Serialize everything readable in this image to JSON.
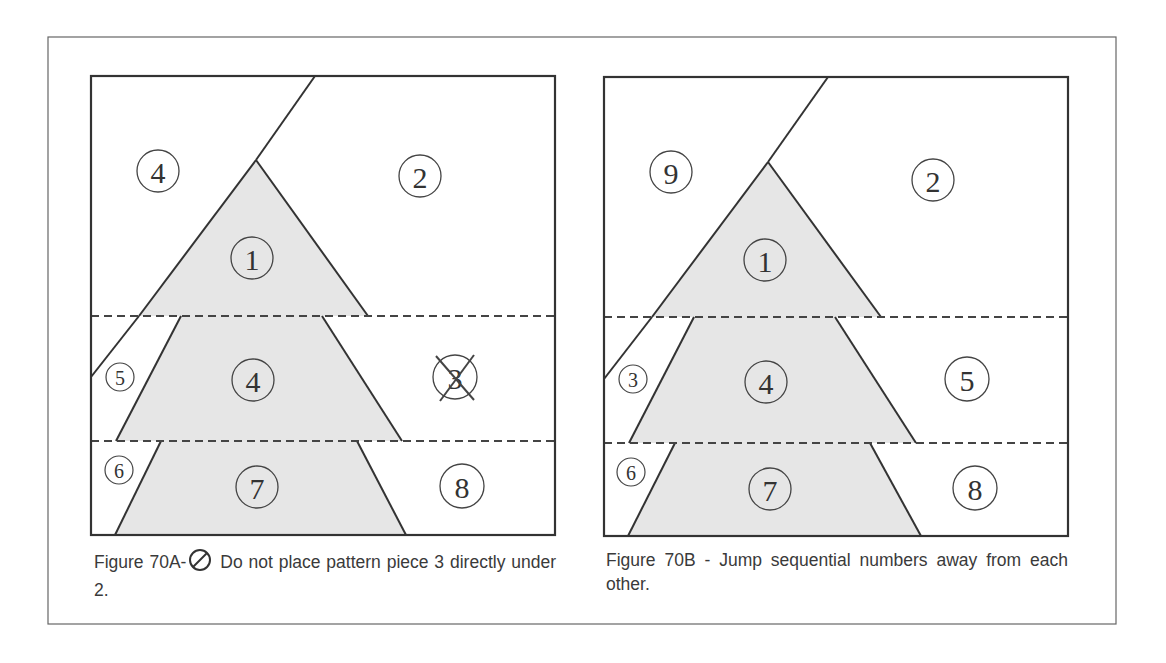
{
  "figure_a": {
    "labels": {
      "top_left": "4",
      "top_right": "2",
      "tier1": "1",
      "side_mid": "5",
      "tier2": "4",
      "right_mid": "3",
      "side_bottom": "6",
      "tier3": "7",
      "right_bottom": "8"
    },
    "crossed_out_label": "3",
    "caption_prefix": "Figure 70A-",
    "caption_icon": "prohibited-icon",
    "caption_text": "Do not place pattern piece 3 directly under 2."
  },
  "figure_b": {
    "labels": {
      "top_left": "9",
      "top_right": "2",
      "tier1": "1",
      "side_mid": "3",
      "tier2": "4",
      "right_mid": "5",
      "side_bottom": "6",
      "tier3": "7",
      "right_bottom": "8"
    },
    "caption": "Figure 70B - Jump sequential numbers away from each other."
  },
  "colors": {
    "line": "#333333",
    "tree_fill": "#e6e6e6",
    "border": "#555555"
  }
}
